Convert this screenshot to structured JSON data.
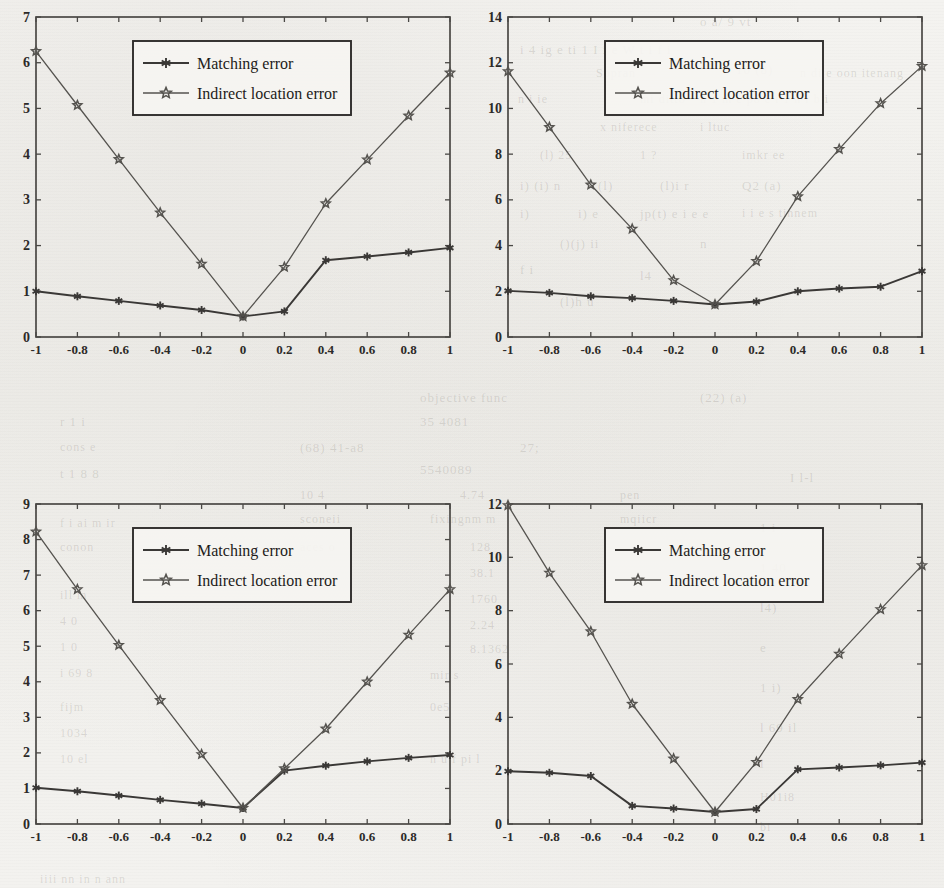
{
  "page": {
    "figure_count": 4,
    "background_note": "scanned page with faint reverse-side bleed-through text"
  },
  "ghost_text": [
    {
      "t": "o a/ 9 vt",
      "x": 700,
      "y": 14,
      "size": 13
    },
    {
      "t": "i 4 ig e ti 1 I i e W t i f i",
      "x": 520,
      "y": 42,
      "size": 13
    },
    {
      "t": "Sopran",
      "x": 596,
      "y": 66,
      "size": 12
    },
    {
      "t": "10 (8)",
      "x": 736,
      "y": 62,
      "size": 13
    },
    {
      "t": "n di e oon itenang",
      "x": 800,
      "y": 66,
      "size": 12
    },
    {
      "t": "n i ie",
      "x": 518,
      "y": 92,
      "size": 12
    },
    {
      "t": "mi ditto",
      "x": 640,
      "y": 92,
      "size": 12
    },
    {
      "t": "n 1 m e po e i 1 n i b i",
      "x": 700,
      "y": 92,
      "size": 12
    },
    {
      "t": "x niferece",
      "x": 600,
      "y": 120,
      "size": 12
    },
    {
      "t": "i ltuc",
      "x": 700,
      "y": 120,
      "size": 12
    },
    {
      "t": "(l) 25",
      "x": 540,
      "y": 148,
      "size": 12
    },
    {
      "t": "1 ?",
      "x": 640,
      "y": 148,
      "size": 12
    },
    {
      "t": "imkr ee",
      "x": 742,
      "y": 148,
      "size": 12
    },
    {
      "t": "i) (i) n",
      "x": 520,
      "y": 178,
      "size": 13
    },
    {
      "t": "(l)",
      "x": 598,
      "y": 178,
      "size": 13
    },
    {
      "t": "(l)i r",
      "x": 660,
      "y": 178,
      "size": 13
    },
    {
      "t": "Q2 (a)",
      "x": 742,
      "y": 178,
      "size": 13
    },
    {
      "t": "i)",
      "x": 520,
      "y": 206,
      "size": 13
    },
    {
      "t": "i) e",
      "x": 578,
      "y": 206,
      "size": 13
    },
    {
      "t": "jp(t) e i e e",
      "x": 640,
      "y": 206,
      "size": 13
    },
    {
      "t": "i i e s tinnem",
      "x": 742,
      "y": 206,
      "size": 12
    },
    {
      "t": "()(j) ii",
      "x": 560,
      "y": 236,
      "size": 13
    },
    {
      "t": "n",
      "x": 700,
      "y": 236,
      "size": 13
    },
    {
      "t": "f i",
      "x": 520,
      "y": 262,
      "size": 13
    },
    {
      "t": "l4",
      "x": 640,
      "y": 268,
      "size": 13
    },
    {
      "t": "(l)h u",
      "x": 560,
      "y": 294,
      "size": 13
    },
    {
      "t": "objective   func",
      "x": 420,
      "y": 390,
      "size": 13
    },
    {
      "t": "(22) (a)",
      "x": 700,
      "y": 390,
      "size": 13
    },
    {
      "t": "35 4081",
      "x": 420,
      "y": 414,
      "size": 13
    },
    {
      "t": "r 1 i",
      "x": 60,
      "y": 414,
      "size": 13
    },
    {
      "t": "(68)  41-a8",
      "x": 300,
      "y": 440,
      "size": 13
    },
    {
      "t": "27;",
      "x": 520,
      "y": 440,
      "size": 13
    },
    {
      "t": "cons e",
      "x": 60,
      "y": 440,
      "size": 12
    },
    {
      "t": "5540089",
      "x": 420,
      "y": 462,
      "size": 13
    },
    {
      "t": "t 1 8 8",
      "x": 60,
      "y": 466,
      "size": 13
    },
    {
      "t": "10 4",
      "x": 300,
      "y": 488,
      "size": 12
    },
    {
      "t": "4.74",
      "x": 460,
      "y": 488,
      "size": 12
    },
    {
      "t": "pen",
      "x": 620,
      "y": 488,
      "size": 12
    },
    {
      "t": "f i ai m ir",
      "x": 60,
      "y": 516,
      "size": 12
    },
    {
      "t": "sconeii",
      "x": 300,
      "y": 512,
      "size": 12
    },
    {
      "t": "fixingnm m",
      "x": 430,
      "y": 512,
      "size": 12
    },
    {
      "t": "mqiicr",
      "x": 620,
      "y": 512,
      "size": 12
    },
    {
      "t": "conon",
      "x": 60,
      "y": 540,
      "size": 12
    },
    {
      "t": "aces o",
      "x": 300,
      "y": 540,
      "size": 12
    },
    {
      "t": "128",
      "x": 470,
      "y": 540,
      "size": 12
    },
    {
      "t": "38.1",
      "x": 470,
      "y": 566,
      "size": 12
    },
    {
      "t": "1760",
      "x": 470,
      "y": 592,
      "size": 12
    },
    {
      "t": "ill m",
      "x": 60,
      "y": 588,
      "size": 12
    },
    {
      "t": "2.24",
      "x": 470,
      "y": 618,
      "size": 12
    },
    {
      "t": "8.1362",
      "x": 470,
      "y": 642,
      "size": 12
    },
    {
      "t": "4 0",
      "x": 60,
      "y": 614,
      "size": 12
    },
    {
      "t": "1 0",
      "x": 60,
      "y": 640,
      "size": 12
    },
    {
      "t": "i 69 8",
      "x": 60,
      "y": 666,
      "size": 12
    },
    {
      "t": "mir s",
      "x": 430,
      "y": 668,
      "size": 12
    },
    {
      "t": "fijm",
      "x": 60,
      "y": 700,
      "size": 12
    },
    {
      "t": "0e5",
      "x": 430,
      "y": 700,
      "size": 12
    },
    {
      "t": "1034",
      "x": 60,
      "y": 726,
      "size": 12
    },
    {
      "t": "10 el",
      "x": 60,
      "y": 752,
      "size": 12
    },
    {
      "t": "n u f  pi l",
      "x": 430,
      "y": 752,
      "size": 12
    },
    {
      "t": "I l-l",
      "x": 790,
      "y": 470,
      "size": 13
    },
    {
      "t": "1 i",
      "x": 760,
      "y": 520,
      "size": 13
    },
    {
      "t": "1 40",
      "x": 760,
      "y": 560,
      "size": 13
    },
    {
      "t": "l4)",
      "x": 760,
      "y": 600,
      "size": 13
    },
    {
      "t": "e",
      "x": 760,
      "y": 640,
      "size": 13
    },
    {
      "t": "1 i)",
      "x": 760,
      "y": 680,
      "size": 13
    },
    {
      "t": "l 69 il",
      "x": 760,
      "y": 720,
      "size": 13
    },
    {
      "t": "l",
      "x": 760,
      "y": 756,
      "size": 13
    },
    {
      "t": "H01i8",
      "x": 760,
      "y": 790,
      "size": 12
    },
    {
      "t": "bi",
      "x": 760,
      "y": 820,
      "size": 12
    },
    {
      "t": "iiii nn in n ann",
      "x": 40,
      "y": 872,
      "size": 12
    }
  ],
  "legend": {
    "entries": [
      {
        "label": "Matching error",
        "marker": "asterisk-filled-icon",
        "color": "#3a3836"
      },
      {
        "label": "Indirect location error",
        "marker": "star-hollow-icon",
        "color": "#55534f"
      }
    ]
  },
  "chart_data": [
    {
      "id": "figure-top-left",
      "type": "line",
      "title": "",
      "xlabel": "",
      "ylabel": "",
      "x": [
        -1,
        -0.8,
        -0.6,
        -0.4,
        -0.2,
        0,
        0.2,
        0.4,
        0.6,
        0.8,
        1
      ],
      "xticklabels": [
        "-1",
        "-0.8",
        "-0.6",
        "-0.4",
        "-0.2",
        "0",
        "0.2",
        "0.4",
        "0.6",
        "0.8",
        "1"
      ],
      "yticklabels": [
        "0",
        "1",
        "2",
        "3",
        "4",
        "5",
        "6",
        "7"
      ],
      "ylim": [
        0,
        7
      ],
      "xlim": [
        -1,
        1
      ],
      "ytick_step": 1,
      "grid": false,
      "legend_position": "top-center",
      "series": [
        {
          "name": "Matching error",
          "marker": "asterisk-filled-icon",
          "color": "#3a3836",
          "values": [
            1.0,
            0.89,
            0.79,
            0.69,
            0.59,
            0.45,
            0.56,
            1.68,
            1.76,
            1.85,
            1.95
          ]
        },
        {
          "name": "Indirect location error",
          "marker": "star-hollow-icon",
          "color": "#55534f",
          "values": [
            6.25,
            5.07,
            3.89,
            2.72,
            1.6,
            0.45,
            1.53,
            2.92,
            3.88,
            4.84,
            5.78
          ]
        }
      ]
    },
    {
      "id": "figure-top-right",
      "type": "line",
      "title": "",
      "xlabel": "",
      "ylabel": "",
      "x": [
        -1,
        -0.8,
        -0.6,
        -0.4,
        -0.2,
        0,
        0.2,
        0.4,
        0.6,
        0.8,
        1
      ],
      "xticklabels": [
        "-1",
        "-0.8",
        "-0.6",
        "-0.4",
        "-0.2",
        "0",
        "0.2",
        "0.4",
        "0.6",
        "0.8",
        "1"
      ],
      "yticklabels": [
        "0",
        "2",
        "4",
        "6",
        "8",
        "10",
        "12",
        "14"
      ],
      "ylim": [
        0,
        14
      ],
      "xlim": [
        -1,
        1
      ],
      "ytick_step": 2,
      "grid": false,
      "legend_position": "top-center",
      "series": [
        {
          "name": "Matching error",
          "marker": "asterisk-filled-icon",
          "color": "#3a3836",
          "values": [
            2.02,
            1.93,
            1.78,
            1.7,
            1.58,
            1.42,
            1.55,
            2.0,
            2.12,
            2.2,
            2.88
          ]
        },
        {
          "name": "Indirect location error",
          "marker": "star-hollow-icon",
          "color": "#55534f",
          "values": [
            11.62,
            9.18,
            6.66,
            4.73,
            2.48,
            1.42,
            3.32,
            6.15,
            8.22,
            10.22,
            11.85
          ]
        }
      ]
    },
    {
      "id": "figure-bottom-left",
      "type": "line",
      "title": "",
      "xlabel": "",
      "ylabel": "",
      "x": [
        -1,
        -0.8,
        -0.6,
        -0.4,
        -0.2,
        0,
        0.2,
        0.4,
        0.6,
        0.8,
        1
      ],
      "xticklabels": [
        "-1",
        "-0.8",
        "-0.6",
        "-0.4",
        "-0.2",
        "0",
        "0.2",
        "0.4",
        "0.6",
        "0.8",
        "1"
      ],
      "yticklabels": [
        "0",
        "1",
        "2",
        "3",
        "4",
        "5",
        "6",
        "7",
        "8",
        "9"
      ],
      "ylim": [
        0,
        9
      ],
      "xlim": [
        -1,
        1
      ],
      "ytick_step": 1,
      "grid": false,
      "legend_position": "top-center",
      "series": [
        {
          "name": "Matching error",
          "marker": "asterisk-filled-icon",
          "color": "#3a3836",
          "values": [
            1.02,
            0.92,
            0.8,
            0.68,
            0.57,
            0.45,
            1.5,
            1.64,
            1.76,
            1.86,
            1.94
          ]
        },
        {
          "name": "Indirect location error",
          "marker": "star-hollow-icon",
          "color": "#55534f",
          "values": [
            8.22,
            6.6,
            5.03,
            3.48,
            1.96,
            0.45,
            1.56,
            2.68,
            4.0,
            5.32,
            6.6
          ]
        }
      ]
    },
    {
      "id": "figure-bottom-right",
      "type": "line",
      "title": "",
      "xlabel": "",
      "ylabel": "",
      "x": [
        -1,
        -0.8,
        -0.6,
        -0.4,
        -0.2,
        0,
        0.2,
        0.4,
        0.6,
        0.8,
        1
      ],
      "xticklabels": [
        "-1",
        "-0.8",
        "-0.6",
        "-0.4",
        "-0.2",
        "0",
        "0.2",
        "0.4",
        "0.6",
        "0.8",
        "1"
      ],
      "yticklabels": [
        "0",
        "2",
        "4",
        "6",
        "8",
        "10",
        "12"
      ],
      "ylim": [
        0,
        12
      ],
      "xlim": [
        -1,
        1
      ],
      "ytick_step": 2,
      "grid": false,
      "legend_position": "top-center",
      "series": [
        {
          "name": "Matching error",
          "marker": "asterisk-filled-icon",
          "color": "#3a3836",
          "values": [
            1.98,
            1.92,
            1.8,
            0.68,
            0.58,
            0.45,
            0.56,
            2.05,
            2.12,
            2.2,
            2.3
          ]
        },
        {
          "name": "Indirect location error",
          "marker": "star-hollow-icon",
          "color": "#55534f",
          "values": [
            11.95,
            9.42,
            7.22,
            4.5,
            2.45,
            0.45,
            2.32,
            4.68,
            6.38,
            8.05,
            9.7
          ]
        }
      ]
    }
  ]
}
